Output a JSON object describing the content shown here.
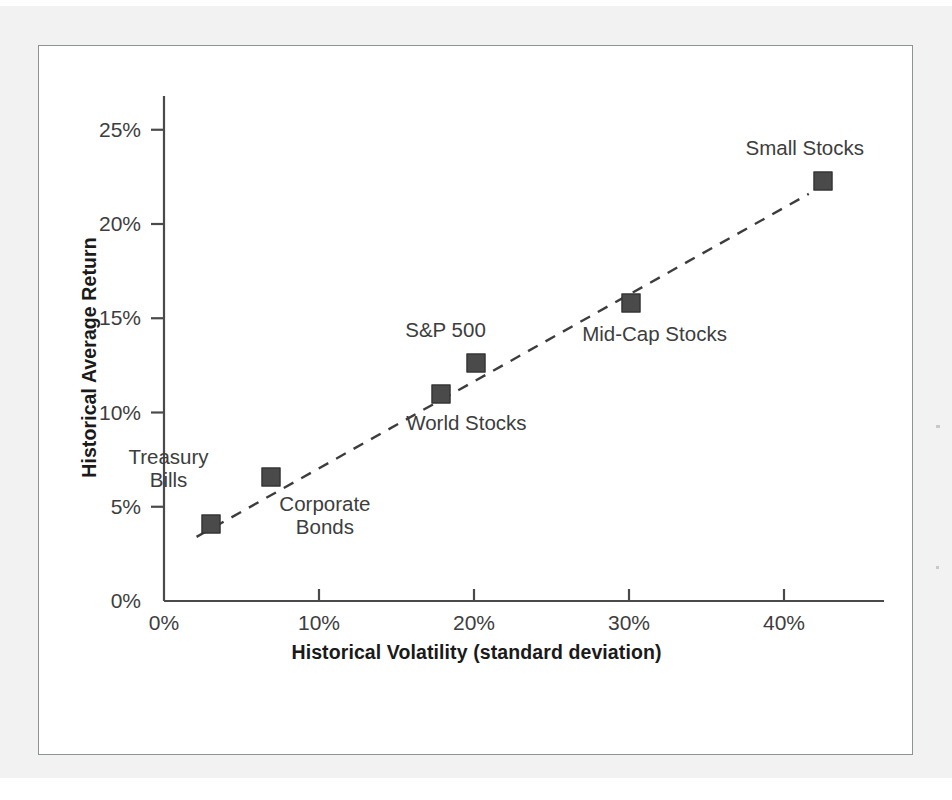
{
  "figure": {
    "background_color": "#ffffff",
    "panel_border_color": "#8d9295",
    "page_color": "#f2f2f2"
  },
  "chart_data": {
    "type": "scatter",
    "title": "",
    "subtitle": "",
    "xlabel": "Historical Volatility (standard deviation)",
    "ylabel": "Historical Average Return",
    "xlim": [
      0,
      46
    ],
    "ylim": [
      0,
      27
    ],
    "grid": false,
    "legend": "none",
    "x_tick_labels": [
      "0%",
      "10%",
      "20%",
      "30%",
      "40%"
    ],
    "x_tick_values": [
      0,
      10,
      20,
      30,
      40
    ],
    "y_tick_labels": [
      "0%",
      "5%",
      "10%",
      "15%",
      "20%",
      "25%"
    ],
    "y_tick_values": [
      0,
      5,
      10,
      15,
      20,
      25
    ],
    "marker_shape": "square",
    "marker_color": "#4a4a4a",
    "trendline": {
      "style": "dashed",
      "color": "#3d3d3d",
      "x_start": 2.1,
      "y_start": 3.4,
      "x_end": 41.6,
      "y_end": 21.6
    },
    "points": [
      {
        "label": "Treasury\nBills",
        "x": 3.0,
        "y": 4.1,
        "label_pos": "above"
      },
      {
        "label": "Corporate\nBonds",
        "x": 6.9,
        "y": 6.6,
        "label_pos": "below-right"
      },
      {
        "label": "World Stocks",
        "x": 17.9,
        "y": 11.0,
        "label_pos": "below"
      },
      {
        "label": "S&P 500",
        "x": 20.1,
        "y": 12.6,
        "label_pos": "above-left"
      },
      {
        "label": "Mid-Cap Stocks",
        "x": 30.1,
        "y": 15.8,
        "label_pos": "below"
      },
      {
        "label": "Small Stocks",
        "x": 42.5,
        "y": 22.3,
        "label_pos": "above-left"
      }
    ]
  },
  "axes": {
    "y_ticks": [
      {
        "label": "25%",
        "value": 25
      },
      {
        "label": "20%",
        "value": 20
      },
      {
        "label": "15%",
        "value": 15
      },
      {
        "label": "10%",
        "value": 10
      },
      {
        "label": "5%",
        "value": 5
      },
      {
        "label": "0%",
        "value": 0
      }
    ],
    "x_ticks": [
      {
        "label": "0%",
        "value": 0
      },
      {
        "label": "10%",
        "value": 10
      },
      {
        "label": "20%",
        "value": 20
      },
      {
        "label": "30%",
        "value": 30
      },
      {
        "label": "40%",
        "value": 40
      }
    ]
  },
  "labels": {
    "y_axis_title": "Historical Average Return",
    "x_axis_title": "Historical Volatility (standard deviation)"
  }
}
